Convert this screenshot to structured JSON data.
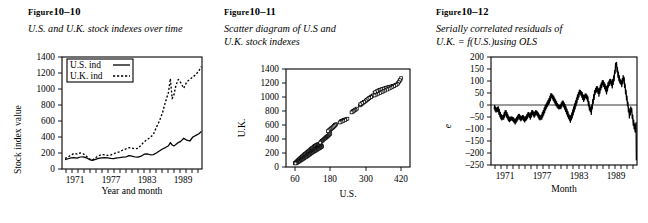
{
  "figures": [
    {
      "label_prefix": "Figure",
      "label_number": "10–10",
      "caption": "U.S. and U.K. stock indexes over time"
    },
    {
      "label_prefix": "Figure",
      "label_number": "10–11",
      "caption": "Scatter diagram of U.S and\nU.K. stock indexes"
    },
    {
      "label_prefix": "Figure",
      "label_number": "10–12",
      "caption": "Serially correlated residuals of\nU.K. = f(U.S.)using OLS"
    }
  ],
  "colors": {
    "ink": "#000000",
    "paper": "#ffffff"
  },
  "chart_data": [
    {
      "type": "line",
      "title": "U.S. and U.K. stock indexes over time",
      "xlabel": "Year and month",
      "ylabel": "Stock index value",
      "ylim": [
        0,
        1400
      ],
      "yticks": [
        0,
        200,
        400,
        600,
        800,
        1000,
        1200,
        1400
      ],
      "xlim": [
        1969.5,
        1992.5
      ],
      "xticks": [
        1971,
        1977,
        1983,
        1989
      ],
      "xtick_labels": [
        "1971",
        "1977",
        "1983",
        "1989"
      ],
      "grid": false,
      "legend_position": "top-left",
      "legend": [
        "U.S. ind",
        "U.K. ind"
      ],
      "x": [
        1970.0,
        1970.5,
        1971.0,
        1971.5,
        1972.0,
        1972.5,
        1973.0,
        1973.5,
        1974.0,
        1974.5,
        1975.0,
        1975.5,
        1976.0,
        1976.5,
        1977.0,
        1977.5,
        1978.0,
        1978.5,
        1979.0,
        1979.5,
        1980.0,
        1980.5,
        1981.0,
        1981.5,
        1982.0,
        1982.5,
        1983.0,
        1983.5,
        1984.0,
        1984.5,
        1985.0,
        1985.5,
        1986.0,
        1986.5,
        1987.0,
        1987.3,
        1987.6,
        1987.9,
        1988.2,
        1988.6,
        1989.0,
        1989.5,
        1990.0,
        1990.5,
        1991.0,
        1991.5,
        1992.0,
        1992.4
      ],
      "series": [
        {
          "name": "U.S. ind",
          "style": "solid",
          "values": [
            118,
            128,
            138,
            142,
            136,
            150,
            152,
            140,
            118,
            108,
            120,
            132,
            140,
            142,
            138,
            132,
            130,
            140,
            142,
            148,
            150,
            168,
            162,
            150,
            148,
            160,
            185,
            190,
            178,
            180,
            200,
            225,
            250,
            268,
            290,
            330,
            300,
            288,
            305,
            330,
            345,
            385,
            360,
            350,
            400,
            420,
            440,
            470
          ]
        },
        {
          "name": "U.K. ind",
          "style": "dashed",
          "values": [
            132,
            150,
            175,
            195,
            185,
            200,
            190,
            160,
            128,
            112,
            140,
            165,
            180,
            178,
            170,
            175,
            190,
            205,
            215,
            238,
            252,
            268,
            262,
            252,
            258,
            300,
            340,
            368,
            395,
            430,
            520,
            600,
            700,
            840,
            960,
            1130,
            880,
            930,
            1040,
            1120,
            1080,
            1010,
            1090,
            1120,
            1150,
            1180,
            1230,
            1280
          ]
        }
      ]
    },
    {
      "type": "scatter",
      "title": "Scatter diagram of U.S and U.K. stock indexes",
      "xlabel": "U.S.",
      "ylabel": "U.K.",
      "ylim": [
        0,
        1400
      ],
      "yticks": [
        0,
        200,
        400,
        600,
        800,
        1000,
        1200,
        1400
      ],
      "xlim": [
        30,
        450
      ],
      "xticks": [
        60,
        180,
        300,
        420
      ],
      "xtick_labels": [
        "60",
        "180",
        "300",
        "420"
      ],
      "grid": false,
      "marker": "open-square",
      "points": [
        [
          60,
          55
        ],
        [
          62,
          62
        ],
        [
          64,
          70
        ],
        [
          66,
          78
        ],
        [
          68,
          85
        ],
        [
          70,
          92
        ],
        [
          72,
          100
        ],
        [
          74,
          108
        ],
        [
          76,
          118
        ],
        [
          78,
          126
        ],
        [
          80,
          132
        ],
        [
          82,
          140
        ],
        [
          84,
          148
        ],
        [
          86,
          155
        ],
        [
          88,
          162
        ],
        [
          90,
          170
        ],
        [
          92,
          178
        ],
        [
          94,
          185
        ],
        [
          96,
          190
        ],
        [
          98,
          198
        ],
        [
          100,
          205
        ],
        [
          102,
          212
        ],
        [
          104,
          218
        ],
        [
          106,
          225
        ],
        [
          108,
          232
        ],
        [
          110,
          240
        ],
        [
          112,
          248
        ],
        [
          114,
          255
        ],
        [
          116,
          262
        ],
        [
          118,
          268
        ],
        [
          120,
          274
        ],
        [
          122,
          280
        ],
        [
          124,
          288
        ],
        [
          126,
          295
        ],
        [
          128,
          300
        ],
        [
          130,
          306
        ],
        [
          132,
          312
        ],
        [
          134,
          318
        ],
        [
          136,
          320
        ],
        [
          138,
          322
        ],
        [
          140,
          325
        ],
        [
          142,
          328
        ],
        [
          144,
          318
        ],
        [
          146,
          312
        ],
        [
          148,
          308
        ],
        [
          150,
          300
        ],
        [
          152,
          295
        ],
        [
          150,
          288
        ],
        [
          148,
          282
        ],
        [
          146,
          276
        ],
        [
          144,
          270
        ],
        [
          142,
          266
        ],
        [
          140,
          262
        ],
        [
          138,
          258
        ],
        [
          136,
          250
        ],
        [
          134,
          245
        ],
        [
          132,
          240
        ],
        [
          130,
          235
        ],
        [
          128,
          230
        ],
        [
          126,
          225
        ],
        [
          124,
          220
        ],
        [
          122,
          215
        ],
        [
          120,
          210
        ],
        [
          118,
          205
        ],
        [
          116,
          200
        ],
        [
          114,
          192
        ],
        [
          112,
          186
        ],
        [
          110,
          180
        ],
        [
          108,
          175
        ],
        [
          106,
          168
        ],
        [
          104,
          162
        ],
        [
          102,
          156
        ],
        [
          100,
          150
        ],
        [
          98,
          145
        ],
        [
          96,
          140
        ],
        [
          94,
          135
        ],
        [
          92,
          128
        ],
        [
          90,
          122
        ],
        [
          88,
          118
        ],
        [
          86,
          112
        ],
        [
          84,
          106
        ],
        [
          82,
          100
        ],
        [
          80,
          95
        ],
        [
          78,
          90
        ],
        [
          76,
          85
        ],
        [
          74,
          80
        ],
        [
          72,
          74
        ],
        [
          70,
          68
        ],
        [
          68,
          62
        ],
        [
          66,
          58
        ],
        [
          64,
          54
        ],
        [
          62,
          50
        ],
        [
          165,
          420
        ],
        [
          168,
          430
        ],
        [
          172,
          445
        ],
        [
          175,
          455
        ],
        [
          178,
          468
        ],
        [
          180,
          478
        ],
        [
          176,
          462
        ],
        [
          172,
          448
        ],
        [
          170,
          440
        ],
        [
          168,
          432
        ],
        [
          166,
          425
        ],
        [
          164,
          418
        ],
        [
          162,
          410
        ],
        [
          160,
          402
        ],
        [
          158,
          395
        ],
        [
          156,
          388
        ],
        [
          154,
          380
        ],
        [
          152,
          372
        ],
        [
          150,
          364
        ],
        [
          148,
          356
        ],
        [
          146,
          348
        ],
        [
          178,
          520
        ],
        [
          180,
          530
        ],
        [
          182,
          540
        ],
        [
          184,
          548
        ],
        [
          186,
          556
        ],
        [
          188,
          562
        ],
        [
          190,
          570
        ],
        [
          192,
          578
        ],
        [
          194,
          586
        ],
        [
          196,
          595
        ],
        [
          198,
          604
        ],
        [
          200,
          612
        ],
        [
          196,
          600
        ],
        [
          192,
          585
        ],
        [
          188,
          570
        ],
        [
          184,
          556
        ],
        [
          180,
          542
        ],
        [
          176,
          528
        ],
        [
          172,
          512
        ],
        [
          215,
          650
        ],
        [
          218,
          658
        ],
        [
          222,
          665
        ],
        [
          226,
          672
        ],
        [
          230,
          678
        ],
        [
          234,
          684
        ],
        [
          238,
          690
        ],
        [
          230,
          672
        ],
        [
          224,
          660
        ],
        [
          218,
          648
        ],
        [
          212,
          636
        ],
        [
          255,
          790
        ],
        [
          258,
          800
        ],
        [
          262,
          812
        ],
        [
          266,
          822
        ],
        [
          270,
          834
        ],
        [
          265,
          818
        ],
        [
          260,
          804
        ],
        [
          256,
          792
        ],
        [
          252,
          780
        ],
        [
          280,
          880
        ],
        [
          284,
          892
        ],
        [
          288,
          904
        ],
        [
          292,
          918
        ],
        [
          296,
          930
        ],
        [
          300,
          944
        ],
        [
          304,
          958
        ],
        [
          308,
          970
        ],
        [
          312,
          984
        ],
        [
          316,
          996
        ],
        [
          320,
          1010
        ],
        [
          324,
          1022
        ],
        [
          318,
          1000
        ],
        [
          312,
          986
        ],
        [
          306,
          968
        ],
        [
          300,
          950
        ],
        [
          294,
          932
        ],
        [
          288,
          914
        ],
        [
          282,
          896
        ],
        [
          330,
          1060
        ],
        [
          336,
          1075
        ],
        [
          342,
          1090
        ],
        [
          348,
          1100
        ],
        [
          354,
          1110
        ],
        [
          360,
          1118
        ],
        [
          366,
          1126
        ],
        [
          372,
          1134
        ],
        [
          378,
          1140
        ],
        [
          384,
          1146
        ],
        [
          390,
          1152
        ],
        [
          396,
          1160
        ],
        [
          344,
          1095
        ],
        [
          338,
          1082
        ],
        [
          332,
          1068
        ],
        [
          350,
          1105
        ],
        [
          356,
          1112
        ],
        [
          362,
          1120
        ],
        [
          368,
          1128
        ],
        [
          374,
          1136
        ],
        [
          380,
          1144
        ],
        [
          386,
          1150
        ],
        [
          392,
          1158
        ],
        [
          398,
          1166
        ],
        [
          404,
          1178
        ],
        [
          410,
          1200
        ],
        [
          414,
          1225
        ],
        [
          418,
          1250
        ],
        [
          420,
          1270
        ],
        [
          416,
          1240
        ],
        [
          412,
          1212
        ],
        [
          408,
          1188
        ],
        [
          402,
          1172
        ],
        [
          396,
          1158
        ],
        [
          390,
          1144
        ],
        [
          384,
          1130
        ],
        [
          378,
          1118
        ],
        [
          372,
          1106
        ],
        [
          366,
          1092
        ],
        [
          360,
          1080
        ],
        [
          354,
          1068
        ],
        [
          348,
          1056
        ],
        [
          342,
          1046
        ],
        [
          336,
          1034
        ],
        [
          330,
          1022
        ]
      ]
    },
    {
      "type": "line",
      "title": "Serially correlated residuals of U.K. = f(U.S.)using OLS",
      "xlabel": "Month",
      "ylabel": "e",
      "ylim": [
        -250,
        200
      ],
      "yticks": [
        -250,
        -200,
        -150,
        -100,
        -50,
        0,
        50,
        100,
        150,
        200
      ],
      "xlim": [
        1969.5,
        1992.5
      ],
      "xticks": [
        1971,
        1977,
        1983,
        1989
      ],
      "xtick_labels": [
        "1971",
        "1977",
        "1983",
        "1989"
      ],
      "grid": false,
      "zero_line": true,
      "x": [
        1970.0,
        1970.3,
        1970.6,
        1970.9,
        1971.2,
        1971.5,
        1971.8,
        1972.1,
        1972.4,
        1972.7,
        1973.0,
        1973.3,
        1973.6,
        1973.9,
        1974.2,
        1974.5,
        1974.8,
        1975.1,
        1975.4,
        1975.7,
        1976.0,
        1976.3,
        1976.6,
        1976.9,
        1977.2,
        1977.5,
        1977.8,
        1978.1,
        1978.4,
        1978.7,
        1979.0,
        1979.3,
        1979.6,
        1979.9,
        1980.2,
        1980.5,
        1980.8,
        1981.1,
        1981.4,
        1981.7,
        1982.0,
        1982.3,
        1982.6,
        1982.9,
        1983.2,
        1983.5,
        1983.8,
        1984.1,
        1984.4,
        1984.7,
        1985.0,
        1985.3,
        1985.6,
        1985.9,
        1986.2,
        1986.5,
        1986.8,
        1987.1,
        1987.4,
        1987.7,
        1988.0,
        1988.3,
        1988.6,
        1988.9,
        1989.2,
        1989.5,
        1989.8,
        1990.1,
        1990.4,
        1990.7,
        1991.0,
        1991.3,
        1991.6,
        1991.9,
        1992.2,
        1992.4
      ],
      "values": [
        -8,
        -22,
        -15,
        -38,
        -55,
        -48,
        -30,
        -48,
        -62,
        -55,
        -60,
        -70,
        -58,
        -45,
        -58,
        -50,
        -62,
        -52,
        -38,
        -48,
        -30,
        -42,
        -30,
        -40,
        -55,
        -48,
        -30,
        -10,
        5,
        20,
        40,
        30,
        15,
        0,
        -10,
        -5,
        10,
        -5,
        -25,
        -45,
        -60,
        -40,
        -15,
        10,
        35,
        55,
        45,
        25,
        40,
        30,
        -10,
        -25,
        20,
        55,
        70,
        50,
        75,
        95,
        80,
        60,
        85,
        100,
        85,
        115,
        175,
        130,
        100,
        90,
        115,
        60,
        10,
        -40,
        -15,
        -70,
        -100,
        -80,
        -230
      ]
    }
  ]
}
